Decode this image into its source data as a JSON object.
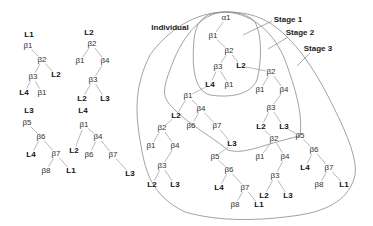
{
  "labels": {
    "individual": "Individual",
    "stage1": "Stage 1",
    "stage2": "Stage 2",
    "stage3": "Stage 3",
    "root": "α1"
  },
  "nodes": [
    {
      "id": "t1_root",
      "text": "L1",
      "x": 29,
      "y": 35,
      "kind": "leaf"
    },
    {
      "id": "t1_b1",
      "text": "β1",
      "x": 28,
      "y": 46,
      "kind": "beta"
    },
    {
      "id": "t1_b2",
      "text": "β2",
      "x": 42,
      "y": 60,
      "kind": "beta"
    },
    {
      "id": "t1_b3",
      "text": "β3",
      "x": 33,
      "y": 77,
      "kind": "beta"
    },
    {
      "id": "t1_L2",
      "text": "L2",
      "x": 56,
      "y": 75,
      "kind": "leaf"
    },
    {
      "id": "t1_L4",
      "text": "L4",
      "x": 24,
      "y": 93,
      "kind": "leaf"
    },
    {
      "id": "t1_b1b",
      "text": "β1",
      "x": 42,
      "y": 93,
      "kind": "beta"
    },
    {
      "id": "t2_root",
      "text": "L2",
      "x": 89,
      "y": 33,
      "kind": "leaf"
    },
    {
      "id": "t2_b2",
      "text": "β2",
      "x": 92,
      "y": 44,
      "kind": "beta"
    },
    {
      "id": "t2_b1",
      "text": "β1",
      "x": 80,
      "y": 61,
      "kind": "beta"
    },
    {
      "id": "t2_b4",
      "text": "β4",
      "x": 105,
      "y": 61,
      "kind": "beta"
    },
    {
      "id": "t2_b3",
      "text": "β3",
      "x": 93,
      "y": 80,
      "kind": "beta"
    },
    {
      "id": "t2_L2",
      "text": "L2",
      "x": 82,
      "y": 99,
      "kind": "leaf"
    },
    {
      "id": "t2_L3",
      "text": "L3",
      "x": 105,
      "y": 99,
      "kind": "leaf"
    },
    {
      "id": "t3_root",
      "text": "L3",
      "x": 29,
      "y": 111,
      "kind": "leaf"
    },
    {
      "id": "t3_b5",
      "text": "β5",
      "x": 27,
      "y": 123,
      "kind": "beta"
    },
    {
      "id": "t3_b6",
      "text": "β6",
      "x": 41,
      "y": 137,
      "kind": "beta"
    },
    {
      "id": "t3_L4",
      "text": "L4",
      "x": 31,
      "y": 155,
      "kind": "leaf"
    },
    {
      "id": "t3_b7",
      "text": "β7",
      "x": 56,
      "y": 154,
      "kind": "beta"
    },
    {
      "id": "t3_b8",
      "text": "β8",
      "x": 46,
      "y": 171,
      "kind": "beta"
    },
    {
      "id": "t3_L1",
      "text": "L1",
      "x": 71,
      "y": 171,
      "kind": "leaf"
    },
    {
      "id": "t4_root",
      "text": "L4",
      "x": 83,
      "y": 111,
      "kind": "leaf"
    },
    {
      "id": "t4_b1",
      "text": "β1",
      "x": 84,
      "y": 125,
      "kind": "beta"
    },
    {
      "id": "t4_b4",
      "text": "β4",
      "x": 98,
      "y": 137,
      "kind": "beta"
    },
    {
      "id": "t4_L2",
      "text": "L2",
      "x": 74,
      "y": 151,
      "kind": "leaf"
    },
    {
      "id": "t4_b6",
      "text": "β6",
      "x": 89,
      "y": 155,
      "kind": "beta"
    },
    {
      "id": "t4_b7",
      "text": "β7",
      "x": 113,
      "y": 155,
      "kind": "beta"
    },
    {
      "id": "t4_L3",
      "text": "L3",
      "x": 130,
      "y": 174,
      "kind": "leaf"
    },
    {
      "id": "m_b1",
      "text": "β1",
      "x": 213,
      "y": 36,
      "kind": "beta"
    },
    {
      "id": "m_b2",
      "text": "β2",
      "x": 229,
      "y": 51,
      "kind": "beta"
    },
    {
      "id": "m_b3",
      "text": "β3",
      "x": 218,
      "y": 67,
      "kind": "beta"
    },
    {
      "id": "m_L2",
      "text": "L2",
      "x": 241,
      "y": 66,
      "kind": "leaf"
    },
    {
      "id": "m_L4",
      "text": "L4",
      "x": 210,
      "y": 85,
      "kind": "leaf"
    },
    {
      "id": "m_b1b",
      "text": "β1",
      "x": 229,
      "y": 85,
      "kind": "beta"
    },
    {
      "id": "s1_b2",
      "text": "β2",
      "x": 271,
      "y": 72,
      "kind": "beta"
    },
    {
      "id": "s1_b1",
      "text": "β1",
      "x": 260,
      "y": 90,
      "kind": "beta"
    },
    {
      "id": "s1_b4",
      "text": "β4",
      "x": 284,
      "y": 90,
      "kind": "beta"
    },
    {
      "id": "s1_b3",
      "text": "β3",
      "x": 271,
      "y": 108,
      "kind": "beta"
    },
    {
      "id": "s1_L2",
      "text": "L2",
      "x": 261,
      "y": 127,
      "kind": "leaf"
    },
    {
      "id": "s1_L3",
      "text": "L3",
      "x": 284,
      "y": 127,
      "kind": "leaf"
    },
    {
      "id": "s2_b1",
      "text": "β1",
      "x": 188,
      "y": 96,
      "kind": "beta"
    },
    {
      "id": "s2_L2",
      "text": "L2",
      "x": 176,
      "y": 116,
      "kind": "leaf"
    },
    {
      "id": "s2_b4",
      "text": "β4",
      "x": 201,
      "y": 109,
      "kind": "beta"
    },
    {
      "id": "s2_b6",
      "text": "β6",
      "x": 191,
      "y": 126,
      "kind": "beta"
    },
    {
      "id": "s2_b7",
      "text": "β7",
      "x": 217,
      "y": 126,
      "kind": "beta"
    },
    {
      "id": "s2_L3",
      "text": "L3",
      "x": 232,
      "y": 144,
      "kind": "leaf"
    },
    {
      "id": "s3_b2",
      "text": "β2",
      "x": 162,
      "y": 128,
      "kind": "beta"
    },
    {
      "id": "s3_b1",
      "text": "β1",
      "x": 151,
      "y": 146,
      "kind": "beta"
    },
    {
      "id": "s3_b4",
      "text": "β4",
      "x": 175,
      "y": 146,
      "kind": "beta"
    },
    {
      "id": "s3_b3",
      "text": "β3",
      "x": 162,
      "y": 166,
      "kind": "beta"
    },
    {
      "id": "s3_L2",
      "text": "L2",
      "x": 152,
      "y": 185,
      "kind": "leaf"
    },
    {
      "id": "s3_L3",
      "text": "L3",
      "x": 175,
      "y": 185,
      "kind": "leaf"
    },
    {
      "id": "s4_b5",
      "text": "β5",
      "x": 215,
      "y": 157,
      "kind": "beta"
    },
    {
      "id": "s4_b6",
      "text": "β6",
      "x": 229,
      "y": 170,
      "kind": "beta"
    },
    {
      "id": "s4_L4",
      "text": "L4",
      "x": 219,
      "y": 188,
      "kind": "leaf"
    },
    {
      "id": "s4_b7",
      "text": "β7",
      "x": 245,
      "y": 188,
      "kind": "beta"
    },
    {
      "id": "s4_b8",
      "text": "β8",
      "x": 235,
      "y": 205,
      "kind": "beta"
    },
    {
      "id": "s4_L1",
      "text": "L1",
      "x": 259,
      "y": 205,
      "kind": "leaf"
    },
    {
      "id": "s5_b2",
      "text": "β2",
      "x": 274,
      "y": 139,
      "kind": "beta"
    },
    {
      "id": "s5_b1",
      "text": "β1",
      "x": 260,
      "y": 157,
      "kind": "beta"
    },
    {
      "id": "s5_b4",
      "text": "β4",
      "x": 285,
      "y": 157,
      "kind": "beta"
    },
    {
      "id": "s5_b3",
      "text": "β3",
      "x": 275,
      "y": 176,
      "kind": "beta"
    },
    {
      "id": "s5_L2",
      "text": "L2",
      "x": 264,
      "y": 196,
      "kind": "leaf"
    },
    {
      "id": "s5_L3",
      "text": "L3",
      "x": 288,
      "y": 196,
      "kind": "leaf"
    },
    {
      "id": "s6_b5",
      "text": "β5",
      "x": 300,
      "y": 136,
      "kind": "beta"
    },
    {
      "id": "s6_b6",
      "text": "β6",
      "x": 314,
      "y": 150,
      "kind": "beta"
    },
    {
      "id": "s6_L4",
      "text": "L4",
      "x": 305,
      "y": 168,
      "kind": "leaf"
    },
    {
      "id": "s6_b7",
      "text": "β7",
      "x": 329,
      "y": 168,
      "kind": "beta"
    },
    {
      "id": "s6_b8",
      "text": "β8",
      "x": 319,
      "y": 185,
      "kind": "beta"
    },
    {
      "id": "s6_L1",
      "text": "L1",
      "x": 344,
      "y": 185,
      "kind": "leaf"
    }
  ],
  "edges": [
    [
      "t1_b1",
      "t1_b2"
    ],
    [
      "t1_b2",
      "t1_b3"
    ],
    [
      "t1_b2",
      "t1_L2"
    ],
    [
      "t1_b3",
      "t1_L4"
    ],
    [
      "t1_b3",
      "t1_b1b"
    ],
    [
      "t2_b2",
      "t2_b1"
    ],
    [
      "t2_b2",
      "t2_b4"
    ],
    [
      "t2_b4",
      "t2_b3"
    ],
    [
      "t2_b3",
      "t2_L2"
    ],
    [
      "t2_b3",
      "t2_L3"
    ],
    [
      "t3_b5",
      "t3_b6"
    ],
    [
      "t3_b6",
      "t3_L4"
    ],
    [
      "t3_b6",
      "t3_b7"
    ],
    [
      "t3_b7",
      "t3_b8"
    ],
    [
      "t3_b7",
      "t3_L1"
    ],
    [
      "t4_b1",
      "t4_L2"
    ],
    [
      "t4_b1",
      "t4_b4"
    ],
    [
      "t4_b4",
      "t4_b6"
    ],
    [
      "t4_b4",
      "t4_b7"
    ],
    [
      "t4_b7",
      "t4_L3"
    ],
    [
      "root",
      "m_b1"
    ],
    [
      "m_b1",
      "m_b2"
    ],
    [
      "m_b2",
      "m_b3"
    ],
    [
      "m_b2",
      "m_L2"
    ],
    [
      "m_b3",
      "m_L4"
    ],
    [
      "m_b3",
      "m_b1b"
    ],
    [
      "m_L2",
      "s1_b2"
    ],
    [
      "s1_b2",
      "s1_b1"
    ],
    [
      "s1_b2",
      "s1_b4"
    ],
    [
      "s1_b4",
      "s1_b3"
    ],
    [
      "s1_b3",
      "s1_L2"
    ],
    [
      "s1_b3",
      "s1_L3"
    ],
    [
      "m_L4",
      "s2_b1"
    ],
    [
      "s2_b1",
      "s2_L2"
    ],
    [
      "s2_b1",
      "s2_b4"
    ],
    [
      "s2_b4",
      "s2_b6"
    ],
    [
      "s2_b4",
      "s2_b7"
    ],
    [
      "s2_b7",
      "s2_L3"
    ],
    [
      "s2_L2",
      "s3_b2"
    ],
    [
      "s3_b2",
      "s3_b1"
    ],
    [
      "s3_b2",
      "s3_b4"
    ],
    [
      "s3_b4",
      "s3_b3"
    ],
    [
      "s3_b3",
      "s3_L2"
    ],
    [
      "s3_b3",
      "s3_L3"
    ],
    [
      "s2_L3",
      "s4_b5"
    ],
    [
      "s4_b5",
      "s4_b6"
    ],
    [
      "s4_b6",
      "s4_L4"
    ],
    [
      "s4_b6",
      "s4_b7"
    ],
    [
      "s4_b7",
      "s4_b8"
    ],
    [
      "s4_b7",
      "s4_L1"
    ],
    [
      "s1_L2",
      "s5_b2"
    ],
    [
      "s5_b2",
      "s5_b1"
    ],
    [
      "s5_b2",
      "s5_b4"
    ],
    [
      "s5_b4",
      "s5_b3"
    ],
    [
      "s5_b3",
      "s5_L2"
    ],
    [
      "s5_b3",
      "s5_L3"
    ],
    [
      "s1_L3",
      "s6_b5"
    ],
    [
      "s6_b5",
      "s6_b6"
    ],
    [
      "s6_b6",
      "s6_L4"
    ],
    [
      "s6_b6",
      "s6_b7"
    ],
    [
      "s6_b7",
      "s6_b8"
    ],
    [
      "s6_b7",
      "s6_L1"
    ]
  ],
  "colors": {
    "line": "#999999",
    "curve": "#8a8a8a",
    "leaf_text": "#111111",
    "beta_text": "#333333"
  }
}
